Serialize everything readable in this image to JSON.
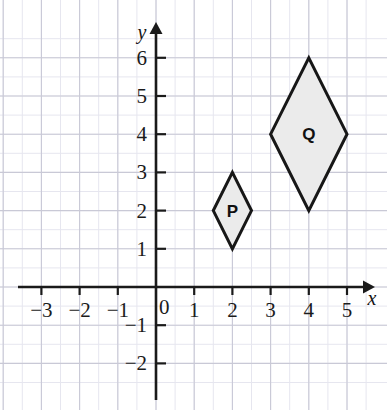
{
  "chart_data": {
    "type": "scatter",
    "title": "",
    "xlabel": "x",
    "ylabel": "y",
    "xlim": [
      -4,
      5.8
    ],
    "ylim": [
      -2.8,
      6.6
    ],
    "grid": true,
    "grid_major_step": 1,
    "grid_minor_step": 0.5,
    "legend": "none",
    "x_ticks": [
      -3,
      -2,
      -1,
      0,
      1,
      2,
      3,
      4,
      5
    ],
    "y_ticks": [
      -2,
      -1,
      1,
      2,
      3,
      4,
      5,
      6
    ],
    "x_tick_labels": [
      "−3",
      "−2",
      "−1",
      "0",
      "1",
      "2",
      "3",
      "4",
      "5"
    ],
    "y_tick_labels": [
      "−2",
      "−1",
      "1",
      "2",
      "3",
      "4",
      "5",
      "6"
    ],
    "origin_label": "0",
    "shapes": [
      {
        "name": "P",
        "label": "P",
        "type": "rhombus",
        "vertices": [
          [
            2,
            3
          ],
          [
            2.5,
            2
          ],
          [
            2,
            1
          ],
          [
            1.5,
            2
          ]
        ],
        "label_position": [
          2,
          2
        ],
        "fill": "#ebebeb",
        "stroke": "#171717"
      },
      {
        "name": "Q",
        "label": "Q",
        "type": "rhombus",
        "vertices": [
          [
            4,
            6
          ],
          [
            5,
            4
          ],
          [
            4,
            2
          ],
          [
            3,
            4
          ]
        ],
        "label_position": [
          4,
          4
        ],
        "fill": "#ebebeb",
        "stroke": "#171717"
      }
    ]
  },
  "axes": {
    "x_axis_name": "x",
    "y_axis_name": "y"
  },
  "colors": {
    "background": "#ffffff",
    "grid_major": "#c9c9d6",
    "grid_minor": "#e6e6ef",
    "axis": "#1a1a1a",
    "shape_fill": "#ebebeb",
    "shape_stroke": "#171717",
    "text": "#1b1b1b"
  }
}
